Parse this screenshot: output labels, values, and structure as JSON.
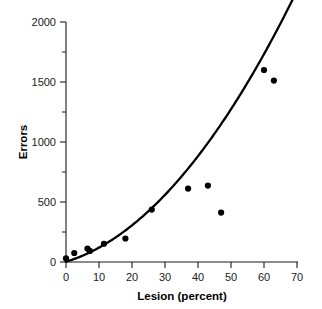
{
  "chart_data": {
    "type": "scatter",
    "title": "",
    "subtitle": "",
    "xlabel": "Lesion (percent)",
    "ylabel": "Errors",
    "xlim": [
      0,
      70
    ],
    "ylim": [
      0,
      2000
    ],
    "x_ticks": [
      0,
      10,
      20,
      30,
      40,
      50,
      60,
      70
    ],
    "y_ticks": [
      0,
      500,
      1000,
      1500,
      2000
    ],
    "y_minor_ticks": [
      250,
      750,
      1250,
      1750
    ],
    "grid": false,
    "legend": null,
    "legend_position": "none",
    "annotations": [],
    "series": [
      {
        "name": "observations",
        "type": "scatter",
        "marker": "filled-circle",
        "color": "#000000",
        "points": [
          {
            "x": 0.0,
            "y": 30
          },
          {
            "x": 2.5,
            "y": 75
          },
          {
            "x": 6.5,
            "y": 112
          },
          {
            "x": 7.2,
            "y": 92
          },
          {
            "x": 11.5,
            "y": 152
          },
          {
            "x": 18.0,
            "y": 196
          },
          {
            "x": 26.0,
            "y": 437
          },
          {
            "x": 37.0,
            "y": 612
          },
          {
            "x": 43.0,
            "y": 637
          },
          {
            "x": 47.0,
            "y": 412
          },
          {
            "x": 60.0,
            "y": 1600
          },
          {
            "x": 63.0,
            "y": 1512
          }
        ]
      },
      {
        "name": "fitted-curve",
        "type": "line",
        "color": "#000000",
        "x_start": 0,
        "x_end": 69,
        "points": [
          {
            "x": 0,
            "y": 132
          },
          {
            "x": 2,
            "y": 112
          },
          {
            "x": 4,
            "y": 99
          },
          {
            "x": 6,
            "y": 92
          },
          {
            "x": 8,
            "y": 91
          },
          {
            "x": 10,
            "y": 96
          },
          {
            "x": 12,
            "y": 107
          },
          {
            "x": 14,
            "y": 124
          },
          {
            "x": 16,
            "y": 147
          },
          {
            "x": 18,
            "y": 176
          },
          {
            "x": 20,
            "y": 211
          },
          {
            "x": 24,
            "y": 298
          },
          {
            "x": 28,
            "y": 409
          },
          {
            "x": 32,
            "y": 543
          },
          {
            "x": 36,
            "y": 700
          },
          {
            "x": 40,
            "y": 881
          },
          {
            "x": 44,
            "y": 1085
          },
          {
            "x": 48,
            "y": 1312
          },
          {
            "x": 52,
            "y": 1562
          },
          {
            "x": 56,
            "y": 1836
          },
          {
            "x": 60,
            "y": 2133
          },
          {
            "x": 63,
            "y": 1512
          },
          {
            "x": 69,
            "y": 1900
          }
        ]
      }
    ]
  },
  "axes": {
    "y_axis": {
      "label": "Errors",
      "tick_labels": [
        "0",
        "500",
        "1000",
        "1500",
        "2000"
      ]
    },
    "x_axis": {
      "label": "Lesion (percent)",
      "tick_labels": [
        "0",
        "10",
        "20",
        "30",
        "40",
        "50",
        "60",
        "70"
      ]
    }
  },
  "colors": {
    "marker": "#000000",
    "curve": "#000000",
    "axis": "#1a1a1a",
    "background": "#ffffff"
  }
}
